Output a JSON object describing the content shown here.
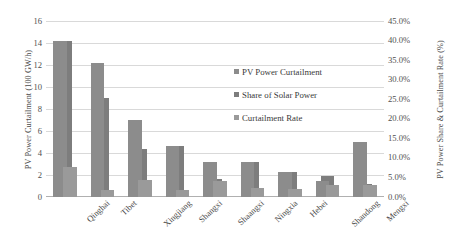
{
  "chart_data": {
    "type": "bar",
    "title": "",
    "subtitle": "",
    "xlabel": "",
    "ylabel": "PV Power Curtailment (100 GW/h)",
    "y2label": "PV Power Share & Curtailment Rate (%)",
    "grid": true,
    "legend_position": "inside-upper-right",
    "categories": [
      "Qinghai",
      "Tibet",
      "Xingjiang",
      "Shangxi",
      "Shaangxi",
      "Ningxia",
      "Hebei",
      "Shandong",
      "Mengxi"
    ],
    "left_axis": {
      "label": "PV Power Curtailment (100 GW/h)",
      "ylim": [
        0,
        16
      ],
      "tick_step": 2,
      "ticks": [
        "0",
        "2",
        "4",
        "6",
        "8",
        "10",
        "12",
        "14",
        "16"
      ]
    },
    "right_axis": {
      "label": "PV Power Share & Curtailment Rate (%)",
      "ylim": [
        0,
        45
      ],
      "tick_step": 5,
      "ticks": [
        "0.0%",
        "5.0%",
        "10.0%",
        "15.0%",
        "20.0%",
        "25.0%",
        "30.0%",
        "35.0%",
        "40.0%",
        "45.0%"
      ]
    },
    "series": [
      {
        "name": "PV Power Curtailment",
        "axis": "left",
        "unit": "100 GW/h",
        "color": "#8c8c8c",
        "values": [
          14.2,
          12.2,
          7.0,
          4.6,
          3.2,
          3.2,
          2.3,
          1.5,
          5.0
        ]
      },
      {
        "name": "Share of Solar Power",
        "axis": "right",
        "unit": "%",
        "color": "#7d7d7d",
        "values": [
          40.0,
          25.3,
          12.3,
          13.0,
          4.6,
          9.0,
          6.4,
          5.4,
          3.4
        ]
      },
      {
        "name": "Curtailment Rate",
        "axis": "right",
        "unit": "%",
        "color": "#9a9a9a",
        "values": [
          7.6,
          1.7,
          4.3,
          1.7,
          4.1,
          2.3,
          2.1,
          3.0,
          3.2
        ]
      }
    ]
  },
  "legend": {
    "items": [
      {
        "label": "PV Power Curtailment",
        "color": "#8c8c8c"
      },
      {
        "label": "Share of Solar Power",
        "color": "#7d7d7d"
      },
      {
        "label": "Curtailment Rate",
        "color": "#9a9a9a"
      }
    ]
  }
}
